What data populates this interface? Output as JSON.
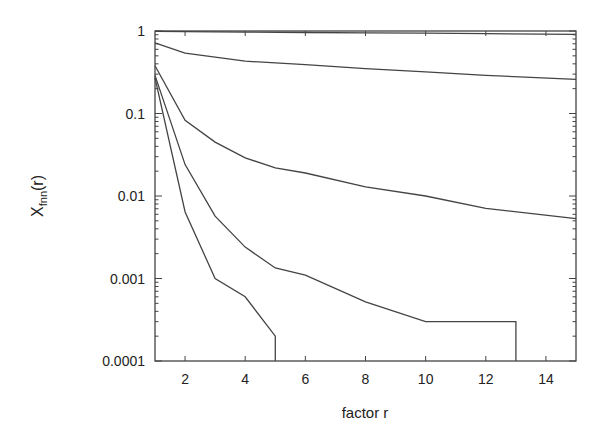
{
  "chart_data": {
    "type": "line",
    "title": "",
    "xlabel": "factor r",
    "ylabel": "X",
    "ylabel_subscript": "fnn",
    "ylabel_suffix": "(r)",
    "xlim": [
      1,
      15
    ],
    "ylim": [
      0.0001,
      1
    ],
    "yscale": "log",
    "grid": false,
    "legend": null,
    "x_ticks": [
      2,
      4,
      6,
      8,
      10,
      12,
      14
    ],
    "x_tick_labels": [
      "2",
      "4",
      "6",
      "8",
      "10",
      "12",
      "14"
    ],
    "y_ticks": [
      1,
      0.1,
      0.01,
      0.001,
      0.0001
    ],
    "y_tick_labels": [
      "1",
      "0.1",
      "0.01",
      "0.001",
      "0.0001"
    ],
    "line_color": "#444444",
    "series": [
      {
        "name": "curve-1",
        "x": [
          1,
          2,
          4,
          6,
          8,
          10,
          12,
          15
        ],
        "y": [
          0.99,
          0.98,
          0.97,
          0.96,
          0.95,
          0.94,
          0.93,
          0.91
        ]
      },
      {
        "name": "curve-2",
        "x": [
          1,
          2,
          4,
          6,
          8,
          10,
          12,
          15
        ],
        "y": [
          0.72,
          0.54,
          0.43,
          0.39,
          0.35,
          0.32,
          0.29,
          0.26
        ]
      },
      {
        "name": "curve-3",
        "x": [
          1,
          2,
          3,
          4,
          5,
          6,
          8,
          10,
          12,
          15
        ],
        "y": [
          0.38,
          0.083,
          0.045,
          0.029,
          0.022,
          0.019,
          0.0129,
          0.01,
          0.0071,
          0.0053
        ]
      },
      {
        "name": "curve-4",
        "x": [
          1,
          2,
          3,
          4,
          5,
          6,
          8,
          10,
          13,
          13
        ],
        "y": [
          0.29,
          0.024,
          0.0057,
          0.0024,
          0.00134,
          0.0011,
          0.00052,
          0.0003,
          0.0003,
          0.0001
        ]
      },
      {
        "name": "curve-5",
        "x": [
          1,
          2,
          3,
          4,
          5,
          5
        ],
        "y": [
          0.27,
          0.0064,
          0.001,
          0.0006,
          0.0002,
          0.0001
        ]
      }
    ]
  }
}
